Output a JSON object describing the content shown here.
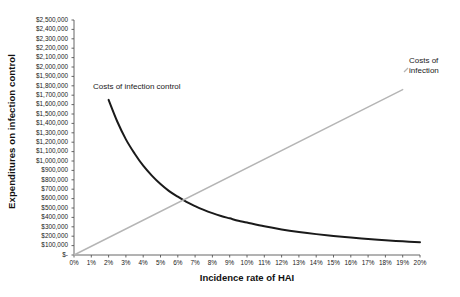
{
  "chart_data": {
    "type": "line",
    "title": "",
    "xlabel": "Incidence rate of HAI",
    "ylabel": "Expenditures on infection control",
    "xlim": [
      0,
      20
    ],
    "ylim": [
      0,
      2500000
    ],
    "grid": false,
    "legend_position": "inline-annotations",
    "x_tick_labels": [
      "0%",
      "1%",
      "2%",
      "3%",
      "4%",
      "5%",
      "6%",
      "7%",
      "8%",
      "9%",
      "10%",
      "11%",
      "12%",
      "13%",
      "14%",
      "15%",
      "16%",
      "17%",
      "18%",
      "19%",
      "20%"
    ],
    "x_tick_values": [
      0,
      1,
      2,
      3,
      4,
      5,
      6,
      7,
      8,
      9,
      10,
      11,
      12,
      13,
      14,
      15,
      16,
      17,
      18,
      19,
      20
    ],
    "y_tick_labels": [
      "$2,500,000",
      "$2,400,000",
      "$2,300,000",
      "$2,200,000",
      "$2,100,000",
      "$2,000,000",
      "$1,900,000",
      "$1,800,000",
      "$1,700,000",
      "$1,600,000",
      "$1,500,000",
      "$1,400,000",
      "$1,300,000",
      "$1,200,000",
      "$1,100,000",
      "$1,000,000",
      "$900,000",
      "$800,000",
      "$700,000",
      "$600,000",
      "$500,000",
      "$400,000",
      "$300,000",
      "$200,000",
      "$100,000",
      "$-"
    ],
    "y_tick_values": [
      2500000,
      2400000,
      2300000,
      2200000,
      2100000,
      2000000,
      1900000,
      1800000,
      1700000,
      1600000,
      1500000,
      1400000,
      1300000,
      1200000,
      1100000,
      1000000,
      900000,
      800000,
      700000,
      600000,
      500000,
      400000,
      300000,
      200000,
      100000,
      0
    ],
    "series": [
      {
        "name": "Costs of infection control",
        "color": "#1a1a1a",
        "x": [
          2,
          2.5,
          3,
          3.5,
          4,
          4.5,
          5,
          5.5,
          6,
          6.5,
          7,
          7.5,
          8,
          8.5,
          9,
          9.5,
          10,
          11,
          12,
          13,
          14,
          15,
          16,
          17,
          18,
          19,
          20
        ],
        "values": [
          1650000,
          1420000,
          1230000,
          1080000,
          950000,
          845000,
          755000,
          680000,
          620000,
          565000,
          520000,
          480000,
          445000,
          415000,
          390000,
          365000,
          345000,
          305000,
          272000,
          245000,
          222000,
          202000,
          185000,
          170000,
          157000,
          145000,
          135000
        ]
      },
      {
        "name": "Costs of infection",
        "color": "#b5b5b5",
        "x": [
          0,
          19
        ],
        "values": [
          0,
          1760000
        ]
      }
    ],
    "annotations": [
      {
        "label": "Costs of infection control",
        "x": 2.0,
        "y": 1820000
      },
      {
        "label": "Costs of\ninfection",
        "x": 19.3,
        "y": 2060000
      }
    ]
  },
  "axis": {
    "y_title": "Expenditures on infection control",
    "x_title": "Incidence rate of HAI"
  },
  "annotations": {
    "control": "Costs of infection control",
    "infection": "Costs of\ninfection"
  },
  "colors": {
    "axis": "#555555",
    "series_control": "#1a1a1a",
    "series_infection": "#b5b5b5",
    "background": "#ffffff"
  }
}
